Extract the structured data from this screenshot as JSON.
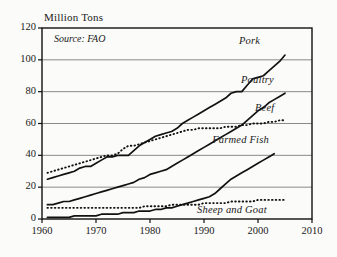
{
  "chart_data": {
    "type": "line",
    "title": "Million Tons",
    "xlabel": "",
    "ylabel": "Million Tons",
    "annotation": "Source: FAO",
    "xlim": [
      1960,
      2010
    ],
    "ylim": [
      0,
      120
    ],
    "grid": true,
    "legend_position": "inline-right-of-line-ends",
    "ytick_labels": [
      "0",
      "20",
      "40",
      "60",
      "80",
      "100",
      "120"
    ],
    "ytick_values": [
      0,
      20,
      40,
      60,
      80,
      100,
      120
    ],
    "xtick_labels": [
      "1960",
      "1970",
      "1980",
      "1990",
      "2000",
      "2010"
    ],
    "xtick_values": [
      1960,
      1970,
      1980,
      1990,
      2000,
      2010
    ],
    "series": [
      {
        "name": "Pork",
        "style": "solid",
        "color": "#111111",
        "x": [
          1961,
          1962,
          1963,
          1964,
          1965,
          1966,
          1967,
          1968,
          1969,
          1970,
          1971,
          1972,
          1973,
          1974,
          1975,
          1976,
          1977,
          1978,
          1979,
          1980,
          1981,
          1982,
          1983,
          1984,
          1985,
          1986,
          1987,
          1988,
          1989,
          1990,
          1991,
          1992,
          1993,
          1994,
          1995,
          1996,
          1997,
          1998,
          1999,
          2000,
          2001,
          2002,
          2003,
          2004,
          2005
        ],
        "values": [
          25,
          26,
          27,
          28,
          29,
          30,
          32,
          33,
          33,
          35,
          37,
          39,
          39,
          40,
          40,
          40,
          43,
          46,
          48,
          50,
          52,
          53,
          54,
          55,
          57,
          60,
          62,
          64,
          66,
          68,
          70,
          72,
          74,
          76,
          79,
          80,
          80,
          84,
          88,
          89,
          90,
          93,
          96,
          99,
          103
        ]
      },
      {
        "name": "Poultry",
        "style": "solid",
        "color": "#111111",
        "x": [
          1961,
          1962,
          1963,
          1964,
          1965,
          1966,
          1967,
          1968,
          1969,
          1970,
          1971,
          1972,
          1973,
          1974,
          1975,
          1976,
          1977,
          1978,
          1979,
          1980,
          1981,
          1982,
          1983,
          1984,
          1985,
          1986,
          1987,
          1988,
          1989,
          1990,
          1991,
          1992,
          1993,
          1994,
          1995,
          1996,
          1997,
          1998,
          1999,
          2000,
          2001,
          2002,
          2003,
          2004,
          2005
        ],
        "values": [
          9,
          9,
          10,
          11,
          11,
          12,
          13,
          14,
          15,
          16,
          17,
          18,
          19,
          20,
          21,
          22,
          23,
          25,
          26,
          28,
          29,
          30,
          31,
          33,
          35,
          37,
          39,
          41,
          43,
          45,
          47,
          49,
          51,
          53,
          55,
          57,
          59,
          62,
          65,
          68,
          70,
          73,
          75,
          77,
          79
        ]
      },
      {
        "name": "Beef",
        "style": "dotted",
        "color": "#111111",
        "x": [
          1961,
          1962,
          1963,
          1964,
          1965,
          1966,
          1967,
          1968,
          1969,
          1970,
          1971,
          1972,
          1973,
          1974,
          1975,
          1976,
          1977,
          1978,
          1979,
          1980,
          1981,
          1982,
          1983,
          1984,
          1985,
          1986,
          1987,
          1988,
          1989,
          1990,
          1991,
          1992,
          1993,
          1994,
          1995,
          1996,
          1997,
          1998,
          1999,
          2000,
          2001,
          2002,
          2003,
          2004,
          2005
        ],
        "values": [
          29,
          30,
          31,
          32,
          33,
          34,
          35,
          36,
          37,
          38,
          39,
          40,
          40,
          41,
          44,
          46,
          46,
          47,
          48,
          49,
          50,
          51,
          52,
          53,
          54,
          55,
          56,
          56,
          57,
          57,
          57,
          57,
          57,
          58,
          58,
          58,
          59,
          59,
          60,
          60,
          60,
          61,
          61,
          62,
          62
        ]
      },
      {
        "name": "Farmed Fish",
        "style": "solid",
        "color": "#111111",
        "x": [
          1961,
          1962,
          1963,
          1964,
          1965,
          1966,
          1967,
          1968,
          1969,
          1970,
          1971,
          1972,
          1973,
          1974,
          1975,
          1976,
          1977,
          1978,
          1979,
          1980,
          1981,
          1982,
          1983,
          1984,
          1985,
          1986,
          1987,
          1988,
          1989,
          1990,
          1991,
          1992,
          1993,
          1994,
          1995,
          1996,
          1997,
          1998,
          1999,
          2000,
          2001,
          2002,
          2003
        ],
        "values": [
          1,
          1,
          1,
          1,
          1,
          2,
          2,
          2,
          2,
          2,
          3,
          3,
          3,
          3,
          4,
          4,
          4,
          5,
          5,
          5,
          6,
          6,
          7,
          7,
          8,
          9,
          10,
          11,
          12,
          13,
          14,
          16,
          19,
          22,
          25,
          27,
          29,
          31,
          33,
          35,
          37,
          39,
          41
        ]
      },
      {
        "name": "Sheep and Goat",
        "style": "dotted",
        "color": "#111111",
        "x": [
          1961,
          1962,
          1963,
          1964,
          1965,
          1966,
          1967,
          1968,
          1969,
          1970,
          1971,
          1972,
          1973,
          1974,
          1975,
          1976,
          1977,
          1978,
          1979,
          1980,
          1981,
          1982,
          1983,
          1984,
          1985,
          1986,
          1987,
          1988,
          1989,
          1990,
          1991,
          1992,
          1993,
          1994,
          1995,
          1996,
          1997,
          1998,
          1999,
          2000,
          2001,
          2002,
          2003,
          2004,
          2005
        ],
        "values": [
          7,
          7,
          7,
          7,
          7,
          7,
          7,
          7,
          7,
          7,
          7,
          7,
          7,
          7,
          7,
          7,
          7,
          7,
          8,
          8,
          8,
          8,
          8,
          9,
          9,
          9,
          9,
          9,
          9,
          10,
          10,
          10,
          10,
          10,
          11,
          11,
          11,
          11,
          11,
          12,
          12,
          12,
          12,
          12,
          12
        ]
      }
    ]
  }
}
